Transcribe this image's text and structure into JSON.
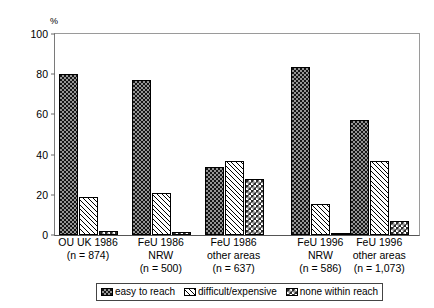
{
  "chart_data": {
    "type": "bar",
    "title": "",
    "subtitle": "",
    "xlabel": "",
    "ylabel": "%",
    "ylim": [
      0,
      100
    ],
    "yticks": [
      0,
      20,
      40,
      60,
      80,
      100
    ],
    "grid": false,
    "legend_position": "bottom",
    "categories": [
      "OU UK 1986",
      "FeU 1986 NRW",
      "FeU 1986 other areas",
      "FeU 1996 NRW",
      "FeU 1996 other areas"
    ],
    "category_lines": [
      [
        "OU UK 1986",
        "(n = 874)"
      ],
      [
        "FeU 1986",
        "NRW",
        "(n = 500)"
      ],
      [
        "FeU 1986",
        "other areas",
        "(n = 637)"
      ],
      [
        "FeU 1996",
        "NRW",
        "(n = 586)"
      ],
      [
        "FeU 1996",
        "other areas",
        "(n = 1,073)"
      ]
    ],
    "sample_sizes": [
      "(n = 874)",
      "(n = 500)",
      "(n = 637)",
      "(n = 586)",
      "(n = 1,073)"
    ],
    "series": [
      {
        "name": "easy to reach",
        "pattern": "pat-dark",
        "values": [
          80,
          77,
          34,
          83.5,
          57
        ]
      },
      {
        "name": "difficult/expensive",
        "pattern": "pat-hatch",
        "values": [
          19,
          21,
          37,
          15.5,
          37
        ]
      },
      {
        "name": "none within reach",
        "pattern": "pat-check",
        "values": [
          2,
          1.5,
          28,
          1,
          7
        ]
      }
    ]
  },
  "axis": {
    "y_unit": "%",
    "tick_labels": [
      "100",
      "80",
      "60",
      "40",
      "20",
      "0"
    ]
  },
  "legend": {
    "items": [
      {
        "label": "easy to reach"
      },
      {
        "label": "difficult/expensive"
      },
      {
        "label": "none within reach"
      }
    ]
  }
}
